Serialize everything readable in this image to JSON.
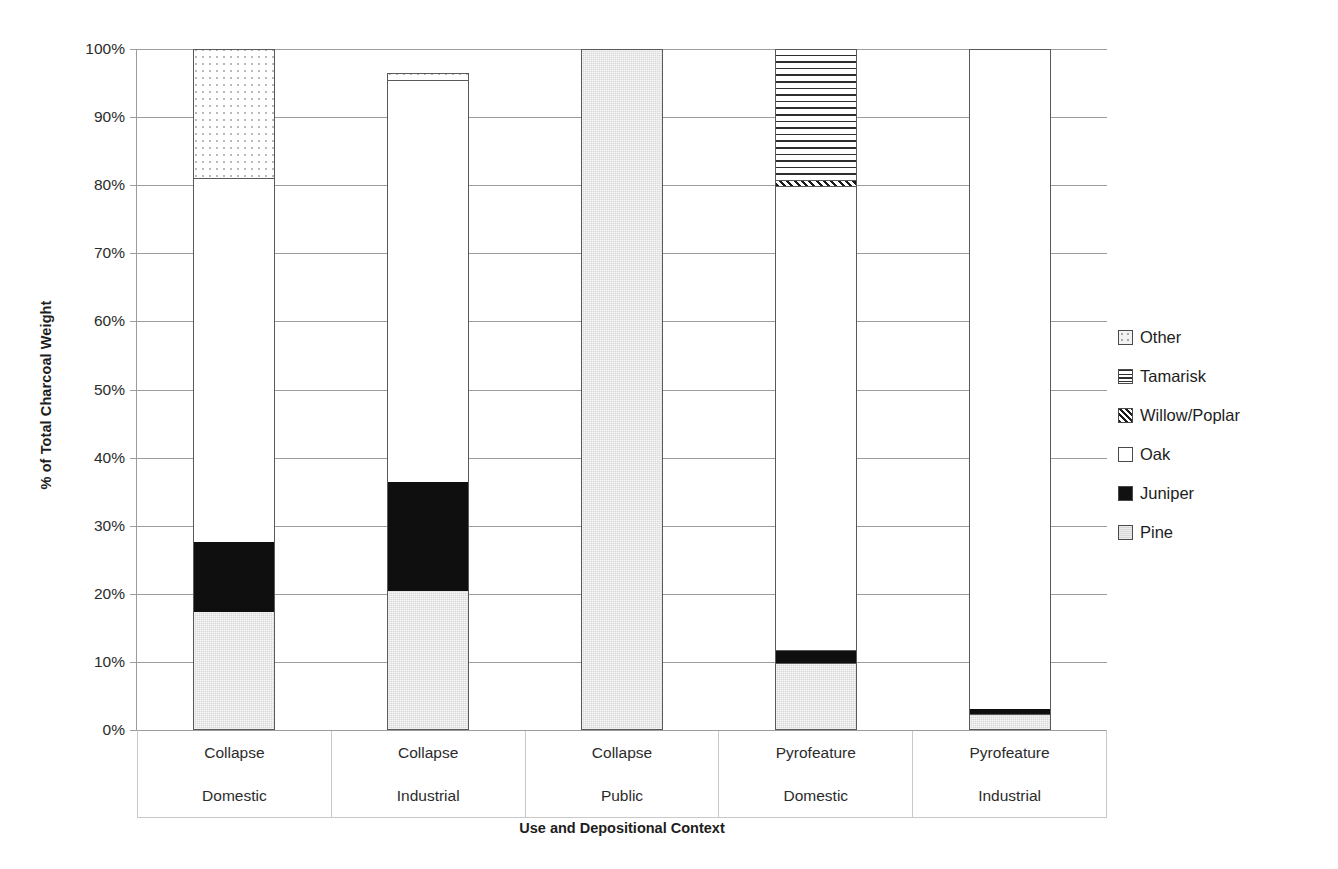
{
  "chart_data": {
    "type": "bar",
    "subtype": "stacked-percentage",
    "title": "",
    "xlabel": "Use and Depositional Context",
    "ylabel": "% of Total Charcoal Weight",
    "ylim": [
      0,
      100
    ],
    "ytick_labels": [
      "100%",
      "90%",
      "80%",
      "70%",
      "60%",
      "50%",
      "40%",
      "30%",
      "20%",
      "10%",
      "0%"
    ],
    "ytick_values": [
      100,
      90,
      80,
      70,
      60,
      50,
      40,
      30,
      20,
      10,
      0
    ],
    "grid": true,
    "legend_position": "right",
    "categories": [
      {
        "primary": "Collapse",
        "secondary": "Domestic"
      },
      {
        "primary": "Collapse",
        "secondary": "Industrial"
      },
      {
        "primary": "Collapse",
        "secondary": "Public"
      },
      {
        "primary": "Pyrofeature",
        "secondary": "Domestic"
      },
      {
        "primary": "Pyrofeature",
        "secondary": "Industrial"
      }
    ],
    "category_labels": [
      "Collapse Domestic",
      "Collapse Industrial",
      "Collapse Public",
      "Pyrofeature Domestic",
      "Pyrofeature Industrial"
    ],
    "series": [
      {
        "name": "Pine",
        "pattern": "light-grey-solid",
        "values": [
          17.2,
          20.3,
          100.0,
          9.7,
          2.2
        ]
      },
      {
        "name": "Juniper",
        "pattern": "black-solid",
        "values": [
          10.3,
          16.0,
          0.0,
          1.9,
          0.8
        ]
      },
      {
        "name": "Oak",
        "pattern": "white-solid",
        "values": [
          53.4,
          59.0,
          0.0,
          68.1,
          97.0
        ]
      },
      {
        "name": "Willow/Poplar",
        "pattern": "diagonal-hatch",
        "values": [
          0.0,
          0.0,
          0.0,
          0.9,
          0.0
        ]
      },
      {
        "name": "Tamarisk",
        "pattern": "horizontal-stripes",
        "values": [
          0.0,
          0.0,
          0.0,
          19.4,
          0.0
        ]
      },
      {
        "name": "Other",
        "pattern": "dotted",
        "values": [
          19.1,
          1.2,
          0.0,
          0.0,
          0.0
        ]
      }
    ],
    "bar_totals": [
      100.0,
      96.5,
      100.0,
      100.0,
      100.0
    ]
  },
  "legend": {
    "items": [
      {
        "label": "Other",
        "swatch": "dotted-swatch"
      },
      {
        "label": "Tamarisk",
        "swatch": "horizontal-stripe-swatch"
      },
      {
        "label": "Willow/Poplar",
        "swatch": "diagonal-hatch-swatch"
      },
      {
        "label": "Oak",
        "swatch": "white-swatch"
      },
      {
        "label": "Juniper",
        "swatch": "black-swatch"
      },
      {
        "label": "Pine",
        "swatch": "grey-swatch"
      }
    ]
  },
  "colors": {
    "pine": "#d8d8d8",
    "juniper": "#100f0f",
    "oak": "#ffffff",
    "outline": "#595959",
    "gridline": "#9c9c9c",
    "text": "#2b2b2b"
  }
}
